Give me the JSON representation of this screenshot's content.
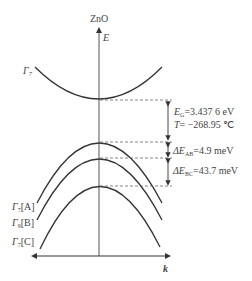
{
  "title": "ZnO",
  "axes": {
    "y_label": "E",
    "x_label": "k"
  },
  "bands": {
    "conduction": {
      "label": "Γ",
      "sub": "7"
    },
    "valence": [
      {
        "label": "Γ",
        "sub": "7",
        "tag": "[A]"
      },
      {
        "label": "Γ",
        "sub": "9",
        "tag": "[B]"
      },
      {
        "label": "Γ",
        "sub": "7",
        "tag": "[C]"
      }
    ]
  },
  "annotations": {
    "gap_symbol": "E",
    "gap_sub": "G",
    "gap_value": "=3.437 6 eV",
    "temp_symbol": "T",
    "temp_value": "= −268.95 ℃",
    "dEab_symbol": "ΔE",
    "dEab_sub": "AB",
    "dEab_value": "=4.9 meV",
    "dEbc_symbol": "ΔE",
    "dEbc_sub": "BC",
    "dEbc_value": "=43.7 meV"
  },
  "colors": {
    "line": "#333333",
    "dash": "#666666"
  }
}
